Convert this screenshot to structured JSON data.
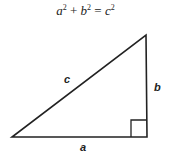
{
  "formula": {
    "a": "a",
    "b": "b",
    "c": "c",
    "exp": "2",
    "plus": "+",
    "equals": "="
  },
  "triangle": {
    "vertices": {
      "left": [
        12,
        137
      ],
      "right_angle": [
        147,
        137
      ],
      "top": [
        146,
        35
      ]
    },
    "right_angle_marker_size": 16,
    "stroke_color": "#222222"
  },
  "labels": {
    "hypotenuse": "c",
    "vertical_leg": "b",
    "horizontal_leg": "a"
  }
}
